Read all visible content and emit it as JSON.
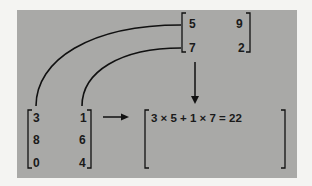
{
  "figure": {
    "background_color": "#a9a9a7",
    "line_color": "#111111"
  },
  "matrix_b": {
    "rows": [
      [
        "5",
        "9"
      ],
      [
        "7",
        "2"
      ]
    ]
  },
  "matrix_a": {
    "rows": [
      [
        "3",
        "1"
      ],
      [
        "8",
        "6"
      ],
      [
        "0",
        "4"
      ]
    ]
  },
  "result_matrix": {
    "first_entry_expression": "3 × 5 + 1 × 7 = 22"
  }
}
